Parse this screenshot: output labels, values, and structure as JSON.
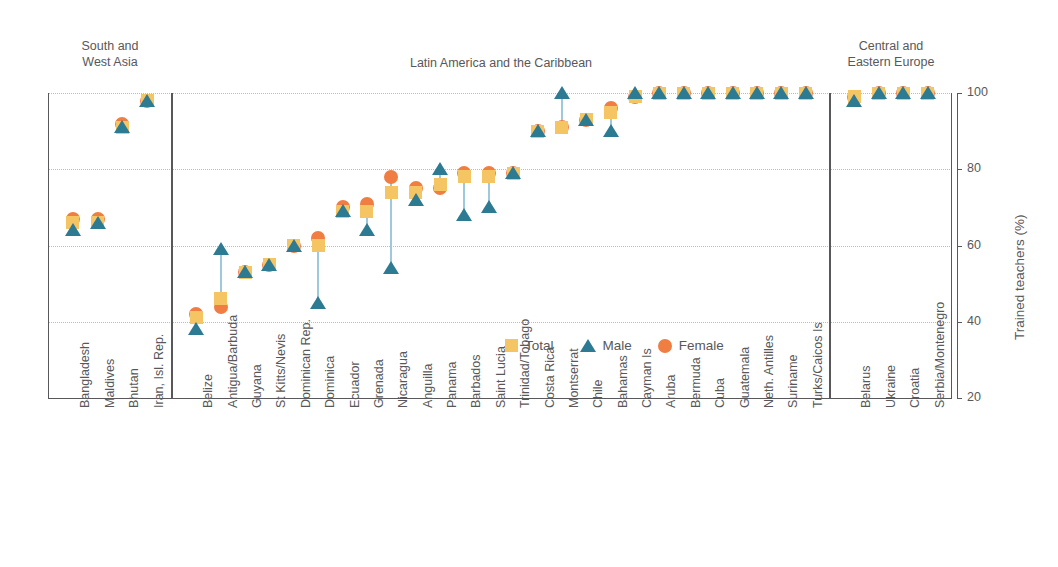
{
  "chart_data": {
    "type": "scatter",
    "title": "",
    "xlabel": "",
    "ylabel": "Trained teachers (%)",
    "ylim": [
      20,
      100
    ],
    "yticks": [
      20,
      40,
      60,
      80,
      100
    ],
    "grid": true,
    "legend_position": "inside-bottom-center",
    "legend": [
      {
        "name": "Total",
        "marker": "square",
        "color": "#f5c463"
      },
      {
        "name": "Male",
        "marker": "triangle",
        "color": "#2d7a93"
      },
      {
        "name": "Female",
        "marker": "circle",
        "color": "#f07d42"
      }
    ],
    "panels": [
      {
        "name": "South and\nWest Asia",
        "categories": [
          "Bangladesh",
          "Maldives",
          "Bhutan",
          "Iran, Isl. Rep."
        ],
        "series": [
          {
            "name": "Total",
            "values": [
              66,
              66,
              91,
              98
            ]
          },
          {
            "name": "Male",
            "values": [
              64,
              66,
              91,
              98
            ]
          },
          {
            "name": "Female",
            "values": [
              67,
              67,
              92,
              98
            ]
          }
        ]
      },
      {
        "name": "Latin America and the Caribbean",
        "categories": [
          "Belize",
          "Antigua/Barbuda",
          "Guyana",
          "St Kitts/Nevis",
          "Dominican Rep.",
          "Dominica",
          "Ecuador",
          "Grenada",
          "Nicaragua",
          "Anguilla",
          "Panama",
          "Barbados",
          "Saint Lucia",
          "Trinidad/Tobago",
          "Costa Rica",
          "Montserrat",
          "Chile",
          "Bahamas",
          "Cayman Is",
          "Aruba",
          "Bermuda",
          "Cuba",
          "Guatemala",
          "Neth. Antilles",
          "Suriname",
          "Turks/Caicos Is"
        ],
        "series": [
          {
            "name": "Total",
            "values": [
              41,
              46,
              53,
              55,
              60,
              60,
              69,
              69,
              74,
              74,
              76,
              78,
              78,
              79,
              90,
              91,
              93,
              95,
              99,
              100,
              100,
              100,
              100,
              100,
              100,
              100
            ]
          },
          {
            "name": "Male",
            "values": [
              38,
              59,
              53,
              55,
              60,
              45,
              69,
              64,
              54,
              72,
              80,
              68,
              70,
              79,
              90,
              100,
              93,
              90,
              100,
              100,
              100,
              100,
              100,
              100,
              100,
              100
            ]
          },
          {
            "name": "Female",
            "values": [
              42,
              44,
              53,
              55,
              60,
              62,
              70,
              71,
              78,
              75,
              75,
              79,
              79,
              79,
              90,
              91,
              93,
              96,
              99,
              100,
              100,
              100,
              100,
              100,
              100,
              100
            ]
          }
        ]
      },
      {
        "name": "Central and\nEastern Europe",
        "categories": [
          "Belarus",
          "Ukraine",
          "Croatia",
          "Serbia/Montenegro"
        ],
        "series": [
          {
            "name": "Total",
            "values": [
              99,
              100,
              100,
              100
            ]
          },
          {
            "name": "Male",
            "values": [
              98,
              100,
              100,
              100
            ]
          },
          {
            "name": "Female",
            "values": [
              99,
              100,
              100,
              100
            ]
          }
        ]
      }
    ]
  }
}
